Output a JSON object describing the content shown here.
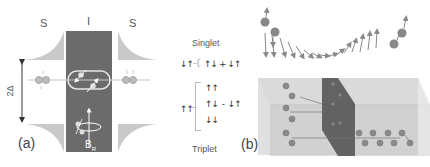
{
  "panel_a": {
    "label": "(a)",
    "region_labels": [
      "S",
      "I",
      "S"
    ],
    "gap_label": "2Δ",
    "field_label": "B",
    "field_subscript": "R",
    "colors": {
      "insulator": "#6e6e6e",
      "superconductor_dos": "#c8c8c8",
      "line": "#cccccc"
    }
  },
  "states": {
    "singlet_label": "Singlet",
    "triplet_label": "Triplet",
    "singlet_left": "↓↑",
    "singlet_expr": [
      "↑↓",
      "+",
      "↓↑"
    ],
    "triplet_left": "↑↑",
    "triplet_states": [
      "↑↑",
      "↑↓  -  ↓↑",
      "↓↓"
    ]
  },
  "panel_b": {
    "label": "(b)",
    "colors": {
      "slab": "#d9d9d9",
      "barrier": "#555555",
      "atom": "#888888",
      "arrow": "#888888"
    }
  }
}
